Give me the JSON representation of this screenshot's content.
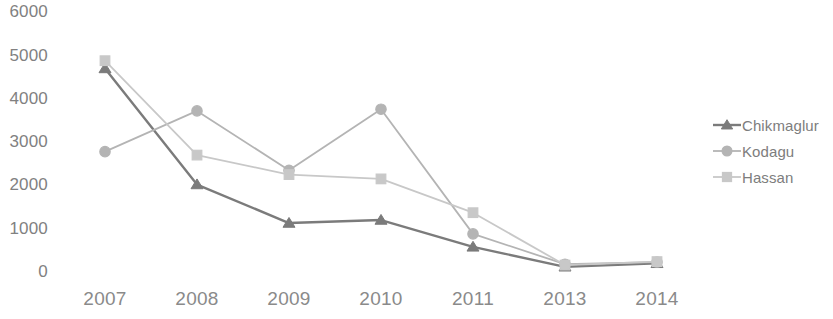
{
  "chart_data": {
    "type": "line",
    "title": "",
    "subtitle": "",
    "xlabel": "",
    "ylabel": "",
    "categories": [
      "2007",
      "2008",
      "2009",
      "2010",
      "2011",
      "2013",
      "2014"
    ],
    "ylim": [
      0,
      6000
    ],
    "y_ticks": [
      6000,
      5000,
      4000,
      3000,
      2000,
      1000,
      0
    ],
    "y_tick_labels": [
      "6000",
      "5000",
      "4000",
      "3000",
      "2000",
      "1000",
      "0"
    ],
    "grid": false,
    "legend_position": "right",
    "series": [
      {
        "name": "Chikmaglur",
        "color": "#7b7b7b",
        "marker": "triangle",
        "values": [
          4700,
          2020,
          1130,
          1200,
          580,
          120,
          200
        ]
      },
      {
        "name": "Kodagu",
        "color": "#b4b4b4",
        "marker": "circle",
        "values": [
          2780,
          3720,
          2350,
          3760,
          880,
          180,
          230
        ]
      },
      {
        "name": "Hassan",
        "color": "#c8c8c8",
        "marker": "square",
        "values": [
          4880,
          2700,
          2250,
          2150,
          1370,
          160,
          240
        ]
      }
    ]
  },
  "legend": {
    "items": [
      {
        "label": "Chikmaglur",
        "icon": "triangle-marker-icon"
      },
      {
        "label": "Kodagu",
        "icon": "circle-marker-icon"
      },
      {
        "label": "Hassan",
        "icon": "square-marker-icon"
      }
    ]
  }
}
